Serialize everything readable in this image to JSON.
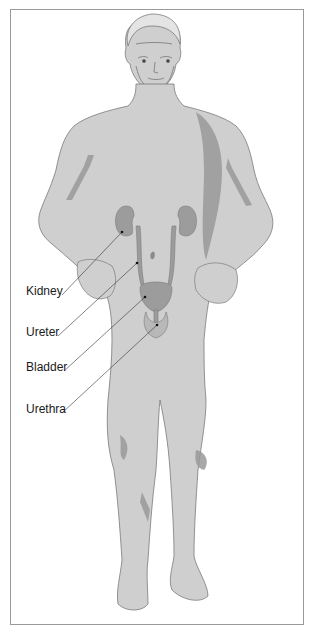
{
  "diagram": {
    "colors": {
      "skin": "#cfcfcf",
      "shadow": "#8e8e8e",
      "organ": "#9c9c9c",
      "outline": "#7a7a7a",
      "leader_line": "#333333",
      "frame": "#9a9a9a"
    },
    "labels": [
      {
        "id": "kidney",
        "text": "Kidney",
        "x": 26,
        "y": 290,
        "target": [
          122,
          232
        ]
      },
      {
        "id": "ureter",
        "text": "Ureter",
        "x": 26,
        "y": 331,
        "target": [
          137,
          263
        ]
      },
      {
        "id": "bladder",
        "text": "Bladder",
        "x": 26,
        "y": 366,
        "target": [
          145,
          297
        ]
      },
      {
        "id": "urethra",
        "text": "Urethra",
        "x": 26,
        "y": 408,
        "target": [
          157,
          325
        ]
      }
    ]
  }
}
